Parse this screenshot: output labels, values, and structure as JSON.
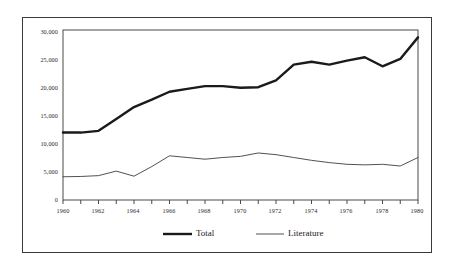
{
  "chart_data": {
    "type": "line",
    "title": "",
    "subtitle": "",
    "xlabel": "",
    "ylabel": "",
    "xlim": [
      1960,
      1980
    ],
    "ylim": [
      0,
      30000
    ],
    "grid": false,
    "legend_position": "bottom",
    "x": [
      1960,
      1961,
      1962,
      1963,
      1964,
      1965,
      1966,
      1967,
      1968,
      1969,
      1970,
      1971,
      1972,
      1973,
      1974,
      1975,
      1976,
      1977,
      1978,
      1979,
      1980
    ],
    "xticks": [
      1960,
      1962,
      1964,
      1966,
      1968,
      1970,
      1972,
      1974,
      1976,
      1978,
      1980
    ],
    "xtick_labels": [
      "1960",
      "1962",
      "1964",
      "1966",
      "1968",
      "1970",
      "1972",
      "1974",
      "1976",
      "1978",
      "1980"
    ],
    "xticks_minor": [
      1961,
      1963,
      1965,
      1967,
      1969,
      1971,
      1973,
      1975,
      1977,
      1979
    ],
    "yticks": [
      0,
      5000,
      10000,
      15000,
      20000,
      25000,
      30000
    ],
    "ytick_labels": [
      "0",
      "5,000",
      "10,000",
      "15,000",
      "20,000",
      "25,000",
      "30,000"
    ],
    "series": [
      {
        "name": "Total",
        "line_width": 2.4,
        "color": "#1a1a1a",
        "values": [
          11900,
          11900,
          12200,
          14300,
          16400,
          17700,
          19100,
          19600,
          20100,
          20100,
          19800,
          19900,
          21100,
          23900,
          24400,
          23900,
          24600,
          25200,
          23600,
          24900,
          28700
        ]
      },
      {
        "name": "Literature",
        "line_width": 0.9,
        "color": "#3d3d3d",
        "values": [
          4100,
          4150,
          4300,
          5100,
          4200,
          5900,
          7800,
          7500,
          7200,
          7500,
          7700,
          8300,
          8000,
          7500,
          7000,
          6600,
          6300,
          6200,
          6300,
          6000,
          7500
        ]
      }
    ],
    "legend": [
      {
        "label": "Total",
        "style": "thick-line",
        "color": "#1a1a1a"
      },
      {
        "label": "Literature",
        "style": "thin-line",
        "color": "#3d3d3d"
      }
    ]
  },
  "axes": {
    "axis_color": "#4a4a4a",
    "frame_color": "#3a3a3a",
    "background": "#ffffff"
  }
}
